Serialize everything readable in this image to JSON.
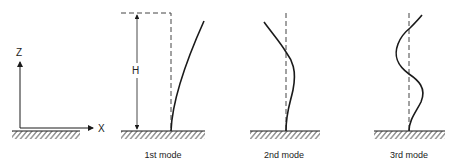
{
  "axes": {
    "z_label": "Z",
    "x_label": "X"
  },
  "dimension": {
    "height_label": "H"
  },
  "modes": [
    {
      "label": "1st mode"
    },
    {
      "label": "2nd mode"
    },
    {
      "label": "3rd mode"
    }
  ],
  "colors": {
    "line": "#1a1a1a",
    "dashed": "#444444",
    "background": "#ffffff"
  }
}
